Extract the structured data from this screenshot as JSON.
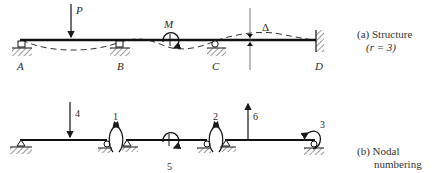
{
  "structure": {
    "caption_line1": "(a) Structure",
    "caption_line2": "(r = 3)",
    "supports": [
      {
        "label": "A",
        "type": "pin-roller"
      },
      {
        "label": "B",
        "type": "roller"
      },
      {
        "label": "C",
        "type": "roller"
      },
      {
        "label": "D",
        "type": "fixed-wall"
      }
    ],
    "loads": {
      "force_label": "P",
      "moment_label": "M",
      "displacement_label": "Δ"
    }
  },
  "nodal": {
    "caption_line1": "(b) Nodal",
    "caption_line2": "numbering",
    "numbers": [
      "1",
      "2",
      "3",
      "4",
      "5",
      "6"
    ]
  },
  "colors": {
    "ink": "#1a1a1a",
    "background": "#ffffff"
  }
}
